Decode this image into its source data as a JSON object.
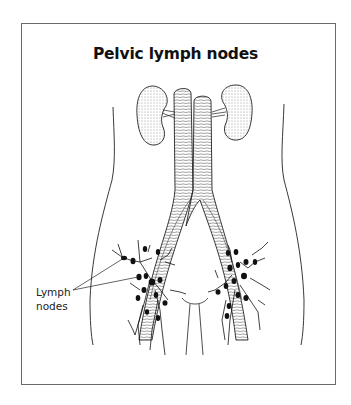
{
  "figure": {
    "title": "Pelvic lymph nodes",
    "labels": [
      {
        "id": "lymph-nodes",
        "line1": "Lymph",
        "line2": "nodes"
      }
    ],
    "structures": [
      "kidney-left",
      "kidney-right",
      "aorta",
      "inferior-vena-cava",
      "iliac-vessels",
      "bladder",
      "lymph-nodes",
      "body-outline"
    ],
    "colors": {
      "ink": "#111111",
      "frame": "#6a6a6a",
      "background": "#ffffff"
    }
  }
}
